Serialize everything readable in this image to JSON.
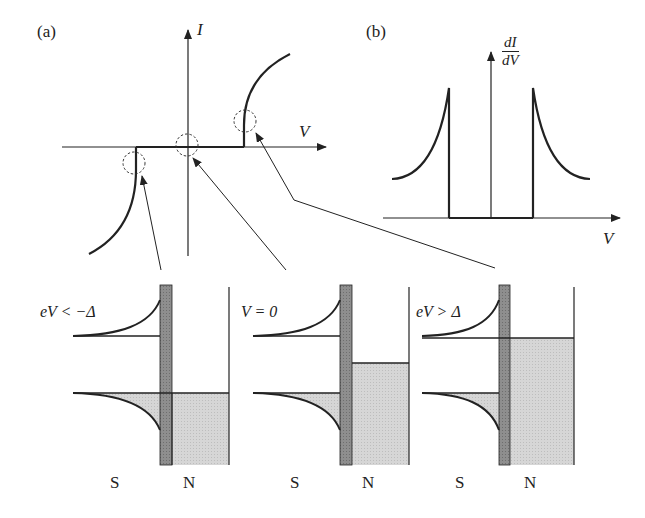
{
  "figure": {
    "panel_a": {
      "label": "(a)",
      "y_axis": "I",
      "x_axis": "V",
      "description": "Current-voltage characteristic of an N-I-S tunnel junction: zero current for |eV| < Δ, sharp onset at ±Δ/e"
    },
    "panel_b": {
      "label": "(b)",
      "y_axis_num": "dI",
      "y_axis_den": "dV",
      "x_axis": "V",
      "description": "Differential conductance showing BCS-like peaks at ±Δ/e and zero within the gap"
    },
    "energy_diagrams": [
      {
        "condition": "eV < −Δ",
        "left_label": "S",
        "right_label": "N"
      },
      {
        "condition": "V = 0",
        "left_label": "S",
        "right_label": "N"
      },
      {
        "condition": "eV > Δ",
        "left_label": "S",
        "right_label": "N"
      }
    ],
    "colors": {
      "line": "#222222",
      "barrier": "#8a8a8a",
      "filled_states": "#d4d4d4"
    }
  }
}
